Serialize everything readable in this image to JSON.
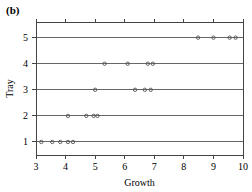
{
  "figure": {
    "panel_label": "(b)",
    "background_color": "#ffffff",
    "axis_color": "#444444",
    "point_color": "#555555"
  },
  "chart_data": {
    "type": "scatter",
    "title": "",
    "subtitle": "",
    "xlabel": "Growth",
    "ylabel": "Tray",
    "xlim": [
      3,
      10
    ],
    "ylim": [
      0.5,
      5.6
    ],
    "xticks": [
      3,
      4,
      5,
      6,
      7,
      8,
      9,
      10
    ],
    "xticklabels": [
      "3",
      "4",
      "5",
      "6",
      "7",
      "8",
      "9",
      "10"
    ],
    "yticks": [
      1,
      2,
      3,
      4,
      5
    ],
    "yticklabels": [
      "1",
      "2",
      "3",
      "4",
      "5"
    ],
    "grid": "horizontal-row-lines",
    "legend": "none",
    "marker": "open-circle",
    "series": [
      {
        "name": "Tray 1",
        "y": 1,
        "values": [
          3.18,
          3.55,
          3.82,
          4.08,
          4.25
        ]
      },
      {
        "name": "Tray 2",
        "y": 2,
        "values": [
          4.08,
          4.7,
          4.95,
          5.08
        ]
      },
      {
        "name": "Tray 3",
        "y": 3,
        "values": [
          5.0,
          6.35,
          6.68,
          6.88
        ]
      },
      {
        "name": "Tray 4",
        "y": 4,
        "values": [
          5.32,
          6.1,
          6.78,
          6.95
        ]
      },
      {
        "name": "Tray 5",
        "y": 5,
        "values": [
          8.48,
          9.0,
          9.55,
          9.75
        ]
      }
    ],
    "annotations": [
      "(b)"
    ]
  }
}
